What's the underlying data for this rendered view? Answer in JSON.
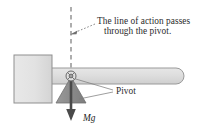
{
  "figure": {
    "background_color": "#ffffff",
    "width": 206,
    "height": 134
  },
  "annotation": {
    "line1": "The line of action passes",
    "line2": "through the pivot.",
    "text_color": "#2b2b2b"
  },
  "labels": {
    "pivot": "Pivot",
    "weight": "Mg"
  },
  "colors": {
    "hammer_head_fill": "#e3e3e3",
    "hammer_head_stroke": "#8f8f8f",
    "handle_fill": "#dcdcdc",
    "handle_stroke": "#9a9a9a",
    "wedge_fill": "#8d8d8d",
    "wedge_stroke": "#6f6f6f",
    "arrow_color": "#4a4a4a",
    "dashed_line_color": "#8c8c8c",
    "leader_line_color": "#777777",
    "pivot_marker_stroke": "#6a6a6a"
  },
  "geometry": {
    "pivot_x": 71,
    "pivot_y": 76,
    "dashed_line_top_y": 7,
    "dashed_line_bottom_y": 76,
    "force_arrow_tip_y": 120
  },
  "elements": {
    "hammer_head": "hammer-head",
    "hammer_handle": "hammer-handle",
    "pivot_marker": "pivot-marker",
    "line_of_action": "line-of-action-dashed",
    "support_wedge": "support-wedge",
    "weight_arrow": "weight-force-arrow",
    "pivot_leader": "pivot-leader-lines",
    "annotation_leader": "annotation-leader-arrow"
  }
}
